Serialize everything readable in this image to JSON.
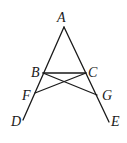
{
  "diagram": {
    "type": "geometry-figure",
    "points": [
      {
        "id": "A",
        "label": "A"
      },
      {
        "id": "B",
        "label": "B"
      },
      {
        "id": "C",
        "label": "C"
      },
      {
        "id": "D",
        "label": "D"
      },
      {
        "id": "E",
        "label": "E"
      },
      {
        "id": "F",
        "label": "F"
      },
      {
        "id": "G",
        "label": "G"
      }
    ],
    "segments": [
      {
        "from": "A",
        "to": "D",
        "through": [
          "B",
          "F"
        ]
      },
      {
        "from": "A",
        "to": "E",
        "through": [
          "C",
          "G"
        ]
      },
      {
        "from": "B",
        "to": "C"
      },
      {
        "from": "B",
        "to": "G"
      },
      {
        "from": "C",
        "to": "F"
      }
    ]
  }
}
